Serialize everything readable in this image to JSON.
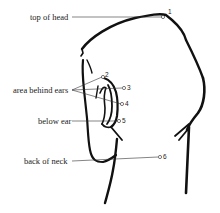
{
  "diagram": {
    "labels": [
      {
        "id": "top-of-head",
        "text": "top of head",
        "point": "1"
      },
      {
        "id": "area-behind-ears",
        "text": "area behind ears",
        "points": [
          "2",
          "3",
          "4"
        ]
      },
      {
        "id": "below-ear",
        "text": "below ear",
        "point": "5"
      },
      {
        "id": "back-of-neck",
        "text": "back of neck",
        "point": "6"
      }
    ],
    "points": [
      "1",
      "2",
      "3",
      "4",
      "5",
      "6"
    ],
    "colors": {
      "ink": "#111111",
      "background": "#ffffff"
    }
  }
}
